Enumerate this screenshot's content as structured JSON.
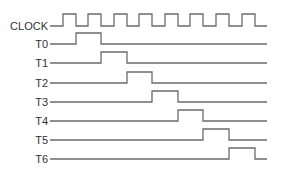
{
  "diagram": {
    "title": "",
    "type": "timing-diagram",
    "line_color": "#6b6b6b",
    "text_color": "#333333",
    "clock": {
      "label": "CLOCK",
      "baseline_y": 26,
      "high_y": 14,
      "start_x": 50,
      "end_x": 267,
      "pulses": [
        {
          "rise": 63,
          "fall": 76
        },
        {
          "rise": 88,
          "fall": 101
        },
        {
          "rise": 114,
          "fall": 127
        },
        {
          "rise": 139,
          "fall": 152
        },
        {
          "rise": 165,
          "fall": 178
        },
        {
          "rise": 190,
          "fall": 203
        },
        {
          "rise": 216,
          "fall": 229
        },
        {
          "rise": 242,
          "fall": 255
        }
      ]
    },
    "signals": [
      {
        "label": "T0",
        "baseline_y": 44,
        "high_from": 76,
        "high_to": 101
      },
      {
        "label": "T1",
        "baseline_y": 63,
        "high_from": 101,
        "high_to": 127
      },
      {
        "label": "T2",
        "baseline_y": 83,
        "high_from": 127,
        "high_to": 152
      },
      {
        "label": "T3",
        "baseline_y": 102,
        "high_from": 152,
        "high_to": 178
      },
      {
        "label": "T4",
        "baseline_y": 121,
        "high_from": 178,
        "high_to": 203
      },
      {
        "label": "T5",
        "baseline_y": 140,
        "high_from": 203,
        "high_to": 229
      },
      {
        "label": "T6",
        "baseline_y": 159,
        "high_from": 229,
        "high_to": 255
      }
    ],
    "signal_high_offset": 11,
    "signal_start_x": 50,
    "signal_end_x": 267
  }
}
